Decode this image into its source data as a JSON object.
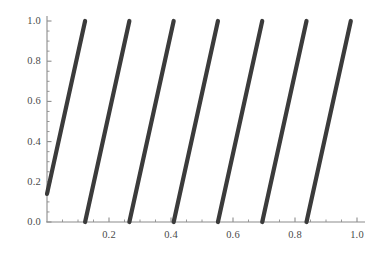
{
  "chart_data": {
    "type": "line",
    "title": "",
    "subtitle": "",
    "xlabel": "",
    "ylabel": "",
    "xlim": [
      0.0,
      1.0
    ],
    "ylim": [
      0.0,
      1.0
    ],
    "grid": false,
    "legend": "none",
    "line_color": "#3b3b3b",
    "axis_color": "#8c8c8c",
    "tick_label_color": "#4a4a4a",
    "line_width": 4.2,
    "x_ticks": [
      {
        "value": 0.2,
        "label": "0.2"
      },
      {
        "value": 0.4,
        "label": "0.4"
      },
      {
        "value": 0.6,
        "label": "0.6"
      },
      {
        "value": 0.8,
        "label": "0.8"
      },
      {
        "value": 1.0,
        "label": "1.0"
      }
    ],
    "x_minor_ticks": [
      0.05,
      0.1,
      0.15,
      0.25,
      0.3,
      0.35,
      0.45,
      0.5,
      0.55,
      0.65,
      0.7,
      0.75,
      0.85,
      0.9,
      0.95
    ],
    "y_ticks": [
      {
        "value": 0.0,
        "label": "0.0"
      },
      {
        "value": 0.2,
        "label": "0.2"
      },
      {
        "value": 0.4,
        "label": "0.4"
      },
      {
        "value": 0.6,
        "label": "0.6"
      },
      {
        "value": 0.8,
        "label": "0.8"
      },
      {
        "value": 1.0,
        "label": "1.0"
      }
    ],
    "y_minor_ticks": [
      0.05,
      0.1,
      0.15,
      0.25,
      0.3,
      0.35,
      0.45,
      0.5,
      0.55,
      0.65,
      0.7,
      0.75,
      0.85,
      0.9,
      0.95
    ],
    "series": [
      {
        "name": "branch-1",
        "x": [
          0.0,
          0.1229
        ],
        "y": [
          0.14,
          1.0
        ]
      },
      {
        "name": "branch-2",
        "x": [
          0.1229,
          0.2657
        ],
        "y": [
          0.0,
          1.0
        ]
      },
      {
        "name": "branch-3",
        "x": [
          0.2657,
          0.4086
        ],
        "y": [
          0.0,
          1.0
        ]
      },
      {
        "name": "branch-4",
        "x": [
          0.4086,
          0.5514
        ],
        "y": [
          0.0,
          1.0
        ]
      },
      {
        "name": "branch-5",
        "x": [
          0.5514,
          0.6943
        ],
        "y": [
          0.0,
          1.0
        ]
      },
      {
        "name": "branch-6",
        "x": [
          0.6943,
          0.8371
        ],
        "y": [
          0.0,
          1.0
        ]
      },
      {
        "name": "branch-7",
        "x": [
          0.8371,
          0.98
        ],
        "y": [
          0.0,
          1.0
        ]
      }
    ]
  }
}
